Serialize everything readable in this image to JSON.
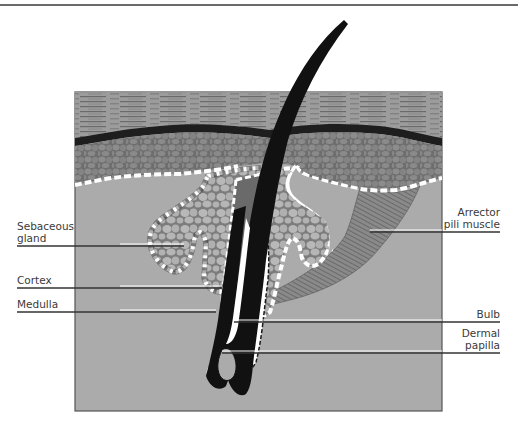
{
  "figure": {
    "page_number": "87",
    "labels": {
      "sebaceous_gland": [
        "Sebaceous",
        "gland"
      ],
      "cortex": "Cortex",
      "medulla": "Medulla",
      "arrector": [
        "Arrector",
        "pili muscle"
      ],
      "bulb": "Bulb",
      "dermal_papilla": [
        "Dermal",
        "papilla"
      ]
    },
    "colors": {
      "dermis": "#ababab",
      "epidermis_cells": "#7a7a7a",
      "cell_fill": "#b4b4b4",
      "stratum_corneum": "#9a9a9a",
      "hair": "#111111",
      "gland_border": "#ffffff"
    }
  }
}
